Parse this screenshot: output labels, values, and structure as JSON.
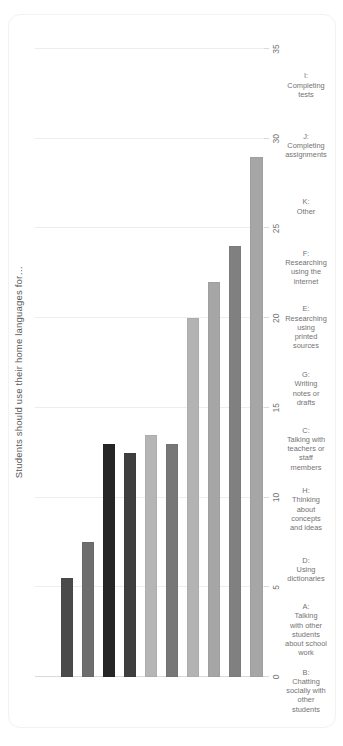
{
  "chart_data": {
    "type": "bar",
    "orientation": "horizontal",
    "rotated_degrees": -90,
    "title": "Students should use their home languages for…",
    "xlabel": "",
    "ylabel": "",
    "xlim": [
      0,
      35
    ],
    "grid": true,
    "legend": "none",
    "tick_labels": [
      "0",
      "5",
      "10",
      "15",
      "20",
      "25",
      "30",
      "35"
    ],
    "tick_values": [
      0,
      5,
      10,
      15,
      20,
      25,
      30,
      35
    ],
    "categories": [
      "B: Chatting socially with other students",
      "A: Talking with other students about school work",
      "D: Using dictionaries",
      "H: Thinking about concepts and ideas",
      "C: Talking with teachers or staff members",
      "G: Writing notes or drafts",
      "E: Researching using printed sources",
      "F: Researching using the internet",
      "K: Other",
      "J: Completing assignments",
      "I: Completing tests"
    ],
    "category_lines": [
      [
        "B:",
        "Chatting",
        "socially with",
        "other",
        "students"
      ],
      [
        "A:",
        "Talking",
        "with other",
        "students",
        "about school",
        "work"
      ],
      [
        "D:",
        "Using",
        "dictionaries"
      ],
      [
        "H:",
        "Thinking",
        "about",
        "concepts",
        "and ideas"
      ],
      [
        "C:",
        "Talking with",
        "teachers or",
        "staff",
        "members"
      ],
      [
        "G:",
        "Writing",
        "notes or",
        "drafts"
      ],
      [
        "E:",
        "Researching",
        "using",
        "printed",
        "sources"
      ],
      [
        "F:",
        "Researching",
        "using the",
        "internet"
      ],
      [
        "K:",
        "Other"
      ],
      [
        "J:",
        "Completing",
        "assignments"
      ],
      [
        "I:",
        "Completing",
        "tests"
      ]
    ],
    "values": [
      29,
      24,
      22,
      20,
      13,
      13.5,
      12.5,
      13,
      7.5,
      5.5,
      0
    ],
    "colors": [
      "#a6a6a6",
      "#808080",
      "#a6a6a6",
      "#b3b3b3",
      "#777777",
      "#b5b5b5",
      "#3f3f3f",
      "#262626",
      "#6e6e6e",
      "#4a4a4a",
      "#ffffff"
    ]
  },
  "style": {
    "background": "#ffffff",
    "grid_color": "#ededed",
    "axis_color": "#d9d9d9",
    "text_color": "#737373",
    "title_color": "#595959",
    "card_border": "#f2f2f2"
  }
}
